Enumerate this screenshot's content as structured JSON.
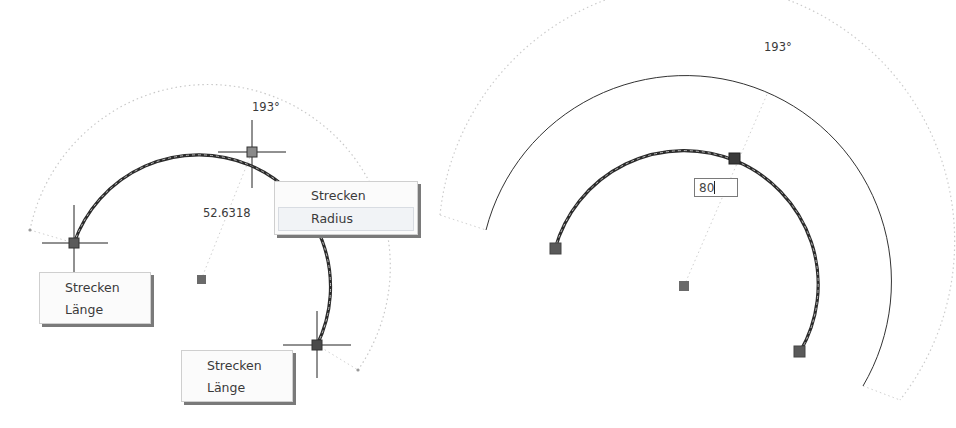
{
  "left_view": {
    "angle_label": "193°",
    "radius_value": "52.6318",
    "grip_menu_mid": {
      "items": [
        {
          "label": "Strecken"
        },
        {
          "label": "Radius"
        }
      ],
      "highlighted_index": 1
    },
    "grip_menu_start": {
      "items": [
        {
          "label": "Strecken"
        },
        {
          "label": "Länge"
        }
      ]
    },
    "grip_menu_end": {
      "items": [
        {
          "label": "Strecken"
        },
        {
          "label": "Länge"
        }
      ]
    }
  },
  "right_view": {
    "angle_label": "193°",
    "radius_input": {
      "value": "80"
    }
  },
  "colors": {
    "arc": "#2b2b2b",
    "grip": "#5a5a5a",
    "dotted": "#c8c8c8",
    "crosshair": "#222222"
  }
}
